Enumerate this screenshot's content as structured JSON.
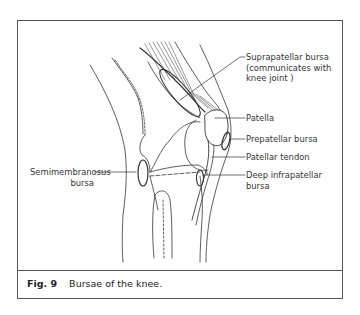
{
  "figure": {
    "number_label": "Fig. 9",
    "title": "Bursae of the knee."
  },
  "labels": {
    "suprapatellar": [
      "Suprapatellar bursa",
      "(communicates with",
      "knee joint )"
    ],
    "patella": "Patella",
    "prepatellar": "Prepatellar bursa",
    "patellar_tendon": "Patellar tendon",
    "deep_infrapatellar": [
      "Deep infrapatellar",
      "bursa"
    ],
    "semimembranosus": [
      "Semimembranosus",
      "bursa"
    ]
  },
  "colors": {
    "line": "#333333",
    "frame": "#555555",
    "background": "#ffffff"
  }
}
